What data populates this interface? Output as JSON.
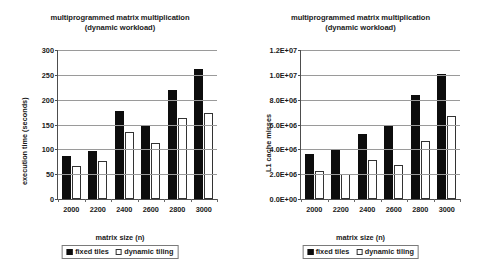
{
  "figure": {
    "background": "#ffffff",
    "series_colors": {
      "fixed_tiles": "#000000",
      "dynamic_tiling": "#ffffff"
    }
  },
  "panels": {
    "left": {
      "title": "multiprogrammed matrix multiplication\n(dynamic workload)",
      "xlabel": "matrix size (n)",
      "ylabel": "execution time (seconds)",
      "yticks": [
        "0",
        "50",
        "100",
        "150",
        "200",
        "250",
        "300"
      ],
      "xticks": [
        "2000",
        "2200",
        "2400",
        "2600",
        "2800",
        "3000"
      ],
      "legend": [
        {
          "label": "fixed tiles",
          "swatch": "filled-square-icon"
        },
        {
          "label": "dynamic tiling",
          "swatch": "hollow-square-icon"
        }
      ]
    },
    "right": {
      "title": "multiprogrammed matrix multiplication\n(dynamic workload)",
      "xlabel": "matrix size (n)",
      "ylabel": "L1 cache misses",
      "yticks": [
        "0.0E+00",
        "2.0E+06",
        "4.0E+06",
        "6.0E+06",
        "8.0E+06",
        "1.0E+07",
        "1.2E+07"
      ],
      "xticks": [
        "2000",
        "2200",
        "2400",
        "2600",
        "2800",
        "3000"
      ],
      "legend": [
        {
          "label": "fixed tiles",
          "swatch": "filled-square-icon"
        },
        {
          "label": "dynamic tiling",
          "swatch": "hollow-square-icon"
        }
      ]
    }
  },
  "chart_data": [
    {
      "id": "execution-time",
      "type": "bar",
      "title": "multiprogrammed matrix multiplication (dynamic workload)",
      "xlabel": "matrix size (n)",
      "ylabel": "execution time (seconds)",
      "categories": [
        "2000",
        "2200",
        "2400",
        "2600",
        "2800",
        "3000"
      ],
      "series": [
        {
          "name": "fixed tiles",
          "values": [
            87,
            97,
            178,
            149,
            219,
            261
          ]
        },
        {
          "name": "dynamic tiling",
          "values": [
            67,
            77,
            135,
            113,
            164,
            174
          ]
        }
      ],
      "ylim": [
        0,
        300
      ],
      "ytick_step": 50,
      "grid": true,
      "legend_position": "bottom"
    },
    {
      "id": "l1-cache-misses",
      "type": "bar",
      "title": "multiprogrammed matrix multiplication (dynamic workload)",
      "xlabel": "matrix size (n)",
      "ylabel": "L1 cache misses",
      "categories": [
        "2000",
        "2200",
        "2400",
        "2600",
        "2800",
        "3000"
      ],
      "series": [
        {
          "name": "fixed tiles",
          "values": [
            3600000,
            4050000,
            5200000,
            5950000,
            8350000,
            10100000
          ]
        },
        {
          "name": "dynamic tiling",
          "values": [
            2250000,
            2000000,
            3150000,
            2700000,
            4650000,
            6650000
          ]
        }
      ],
      "ylim": [
        0,
        12000000
      ],
      "ytick_step": 2000000,
      "grid": true,
      "legend_position": "bottom"
    }
  ]
}
